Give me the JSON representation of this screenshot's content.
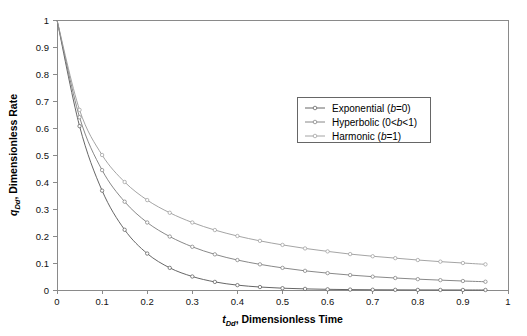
{
  "chart_data": {
    "type": "line",
    "title": "",
    "xlabel": "tDd, Dimensionless Time",
    "xlabel_sym": "t",
    "xlabel_sub": "Dd",
    "xlabel_rest": ", Dimensionless Time",
    "ylabel": "qDd, Dimensionless Rate",
    "ylabel_sym": "q",
    "ylabel_sub": "Dd",
    "ylabel_rest": ", Dimensionless Rate",
    "xlim": [
      0,
      1
    ],
    "ylim": [
      0,
      1
    ],
    "xticks": [
      "0",
      "0.1",
      "0.2",
      "0.3",
      "0.4",
      "0.5",
      "0.6",
      "0.7",
      "0.8",
      "0.9",
      "1"
    ],
    "xtick_values": [
      0,
      0.1,
      0.2,
      0.3,
      0.4,
      0.5,
      0.6,
      0.7,
      0.8,
      0.9,
      1
    ],
    "yticks": [
      "0",
      "0.1",
      "0.2",
      "0.3",
      "0.4",
      "0.5",
      "0.6",
      "0.7",
      "0.8",
      "0.9",
      "1"
    ],
    "ytick_values": [
      0,
      0.1,
      0.2,
      0.3,
      0.4,
      0.5,
      0.6,
      0.7,
      0.8,
      0.9,
      1
    ],
    "grid": false,
    "legend_position": "upper-right-inside",
    "x": [
      0,
      0.05,
      0.1,
      0.15,
      0.2,
      0.25,
      0.3,
      0.35,
      0.4,
      0.45,
      0.5,
      0.55,
      0.6,
      0.65,
      0.7,
      0.75,
      0.8,
      0.85,
      0.9,
      0.95
    ],
    "series": [
      {
        "name": "Exponential (b=0)",
        "label_text": "Exponential (",
        "label_sym": "b",
        "label_tail": "=0)",
        "color": "#555555",
        "values": [
          1.0,
          0.607,
          0.368,
          0.223,
          0.135,
          0.082,
          0.05,
          0.03,
          0.018,
          0.011,
          0.0067,
          0.0041,
          0.0025,
          0.0015,
          0.0009,
          0.00055,
          0.00034,
          0.0002,
          0.00012,
          7e-05
        ]
      },
      {
        "name": "Hyperbolic (0<b<1)",
        "label_text": "Hyperbolic (0<",
        "label_sym": "b",
        "label_tail": "<1)",
        "color": "#7a7a7a",
        "values": [
          1.0,
          0.64,
          0.444,
          0.327,
          0.25,
          0.198,
          0.16,
          0.132,
          0.111,
          0.095,
          0.082,
          0.071,
          0.0625,
          0.0553,
          0.0494,
          0.0444,
          0.0401,
          0.0365,
          0.0333,
          0.0306
        ]
      },
      {
        "name": "Harmonic (b=1)",
        "label_text": "Harmonic (",
        "label_sym": "b",
        "label_tail": "=1)",
        "color": "#9a9a9a",
        "values": [
          1.0,
          0.667,
          0.5,
          0.4,
          0.333,
          0.286,
          0.25,
          0.222,
          0.2,
          0.182,
          0.167,
          0.154,
          0.143,
          0.133,
          0.125,
          0.118,
          0.111,
          0.105,
          0.1,
          0.095
        ]
      }
    ]
  },
  "plot_geometry": {
    "left": 57,
    "right": 508,
    "top": 20,
    "bottom": 290
  },
  "legend_geometry": {
    "x": 297,
    "y": 97,
    "width": 133,
    "height": 45
  }
}
